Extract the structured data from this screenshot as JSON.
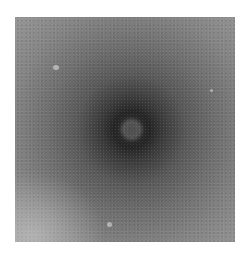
{
  "image": {
    "description": "Grayscale micrograph with a dark circular halo surrounding a lighter round particle at center",
    "colors": {
      "background": "#ffffff",
      "center_particle": "#4e4e4e",
      "halo": "#262626",
      "edges": "#b0b0b0"
    }
  }
}
